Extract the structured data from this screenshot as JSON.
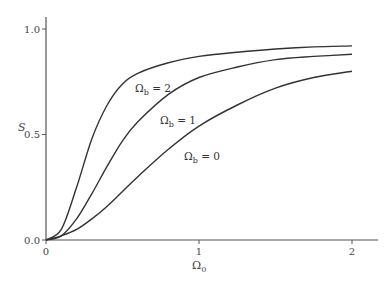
{
  "chart_data": {
    "type": "line",
    "title": "",
    "xlabel": "Ω0",
    "ylabel": "S",
    "xlim": [
      0,
      2.15
    ],
    "ylim": [
      0,
      1.05
    ],
    "grid": false,
    "legend": "inline labels on curves",
    "x_ticks": [
      0,
      1,
      2
    ],
    "x_tick_labels": [
      "0",
      "1",
      "2"
    ],
    "y_ticks": [
      0.0,
      0.5,
      1.0
    ],
    "y_tick_labels": [
      "0.0",
      "0.5",
      "1.0"
    ],
    "x": [
      0,
      0.1,
      0.2,
      0.3,
      0.4,
      0.5,
      0.6,
      0.8,
      1.0,
      1.25,
      1.5,
      1.75,
      2.0
    ],
    "series": [
      {
        "name": "Ωb = 2",
        "values": [
          0,
          0.05,
          0.25,
          0.48,
          0.64,
          0.74,
          0.79,
          0.84,
          0.87,
          0.89,
          0.905,
          0.915,
          0.92
        ]
      },
      {
        "name": "Ωb = 1",
        "values": [
          0,
          0.02,
          0.1,
          0.22,
          0.35,
          0.47,
          0.56,
          0.69,
          0.77,
          0.82,
          0.855,
          0.87,
          0.88
        ]
      },
      {
        "name": "Ωb = 0",
        "values": [
          0,
          0.02,
          0.05,
          0.1,
          0.16,
          0.23,
          0.3,
          0.43,
          0.54,
          0.64,
          0.72,
          0.77,
          0.8
        ]
      }
    ],
    "annotations": [
      {
        "text": "Ωb = 2",
        "x": 0.58,
        "y": 0.78
      },
      {
        "text": "Ωb = 1",
        "x": 0.75,
        "y": 0.6
      },
      {
        "text": "Ωb = 0",
        "x": 1.08,
        "y": 0.38
      }
    ]
  },
  "labels": {
    "y_axis": "S",
    "x_axis_main": "Ω",
    "x_axis_sub": "0",
    "curve_main": "Ω",
    "curve_sub": "b",
    "curve2_eq": " = 2",
    "curve1_eq": " = 1",
    "curve0_eq": " = 0"
  }
}
